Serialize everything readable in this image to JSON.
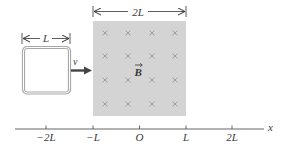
{
  "figure": {
    "loop": {
      "width_label": "L",
      "velocity_label": "v"
    },
    "field": {
      "width_label": "2L",
      "field_label": "B",
      "field_direction": "into-page",
      "rows": 4,
      "cols": 4,
      "fill_color": "#d4d4d4"
    },
    "axis": {
      "axis_label": "x",
      "ticks": [
        "−2L",
        "−L",
        "O",
        "L",
        "2L"
      ]
    }
  }
}
